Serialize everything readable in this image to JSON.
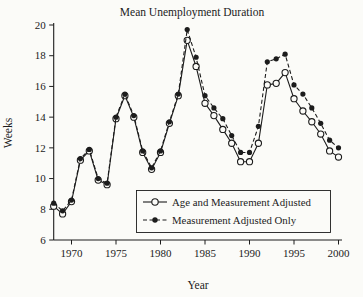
{
  "colors": {
    "ink": "#1c1c1c",
    "background": "#fbfbf8",
    "marker_open_fill": "#fbfbf8"
  },
  "chart_data": {
    "type": "line",
    "title": "Mean Unemployment Duration",
    "xlabel": "Year",
    "ylabel": "Weeks",
    "xlim": [
      1968,
      2000
    ],
    "ylim": [
      6,
      20
    ],
    "x_ticks": [
      1970,
      1975,
      1980,
      1985,
      1990,
      1995,
      2000
    ],
    "y_ticks": [
      6,
      8,
      10,
      12,
      14,
      16,
      18,
      20
    ],
    "grid": false,
    "legend_position": "inside-lower-right",
    "x": [
      1968,
      1969,
      1970,
      1971,
      1972,
      1973,
      1974,
      1975,
      1976,
      1977,
      1978,
      1979,
      1980,
      1981,
      1982,
      1983,
      1984,
      1985,
      1986,
      1987,
      1988,
      1989,
      1990,
      1991,
      1992,
      1993,
      1994,
      1995,
      1996,
      1997,
      1998,
      1999,
      2000
    ],
    "series": [
      {
        "name": "Age and Measurement Adjusted",
        "marker": "open-circle",
        "line_style": "solid",
        "values": [
          8.2,
          7.7,
          8.5,
          11.2,
          11.8,
          9.9,
          9.6,
          13.9,
          15.4,
          14.0,
          11.7,
          10.6,
          11.7,
          13.6,
          15.4,
          19.0,
          17.3,
          14.9,
          14.1,
          13.2,
          12.3,
          11.1,
          11.1,
          12.3,
          16.1,
          16.2,
          16.9,
          15.2,
          14.4,
          13.7,
          12.9,
          11.8,
          11.4
        ]
      },
      {
        "name": "Measurement Adjusted Only",
        "marker": "filled-circle",
        "line_style": "dashed",
        "values": [
          8.4,
          7.9,
          8.6,
          11.3,
          11.9,
          10.0,
          9.7,
          14.0,
          15.5,
          14.1,
          11.8,
          10.7,
          11.8,
          13.7,
          15.5,
          19.7,
          17.9,
          15.4,
          14.6,
          13.9,
          12.8,
          11.7,
          11.7,
          13.4,
          17.6,
          17.8,
          18.1,
          16.1,
          15.5,
          14.6,
          13.6,
          12.5,
          12.0
        ]
      }
    ]
  }
}
